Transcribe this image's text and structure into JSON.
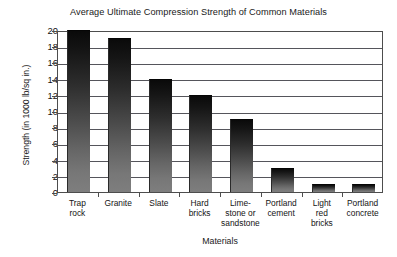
{
  "chart_data": {
    "type": "bar",
    "title": "Average Ultimate Compression Strength of Common Materials",
    "xlabel": "Materials",
    "ylabel": "Strength (in 1000 lb/sq in.)",
    "categories": [
      "Trap rock",
      "Granite",
      "Slate",
      "Hard bricks",
      "Lime-stone or sandstone",
      "Portland cement",
      "Light red bricks",
      "Portland concrete"
    ],
    "category_lines": [
      [
        "Trap",
        "rock"
      ],
      [
        "Granite"
      ],
      [
        "Slate"
      ],
      [
        "Hard",
        "bricks"
      ],
      [
        "Lime-",
        "stone or",
        "sandstone"
      ],
      [
        "Portland",
        "cement"
      ],
      [
        "Light",
        "red",
        "bricks"
      ],
      [
        "Portland",
        "concrete"
      ]
    ],
    "values": [
      20,
      19,
      14,
      12,
      9,
      3,
      1,
      1
    ],
    "ylim": [
      0,
      20
    ],
    "ytick_step": 2,
    "yticks": [
      20,
      18,
      16,
      14,
      12,
      10,
      8,
      6,
      4,
      2,
      0
    ],
    "grid": true,
    "grid_axis": "y",
    "legend": "none",
    "bar_fill_top_color": "#0a0a0a",
    "bar_fill_bottom_color": "#7e7e7e",
    "bar_shadow_color": "#b9b9b9",
    "axis_color": "#4d4d4d",
    "gridline_color": "#55555b",
    "background_color": "#ffffff"
  }
}
